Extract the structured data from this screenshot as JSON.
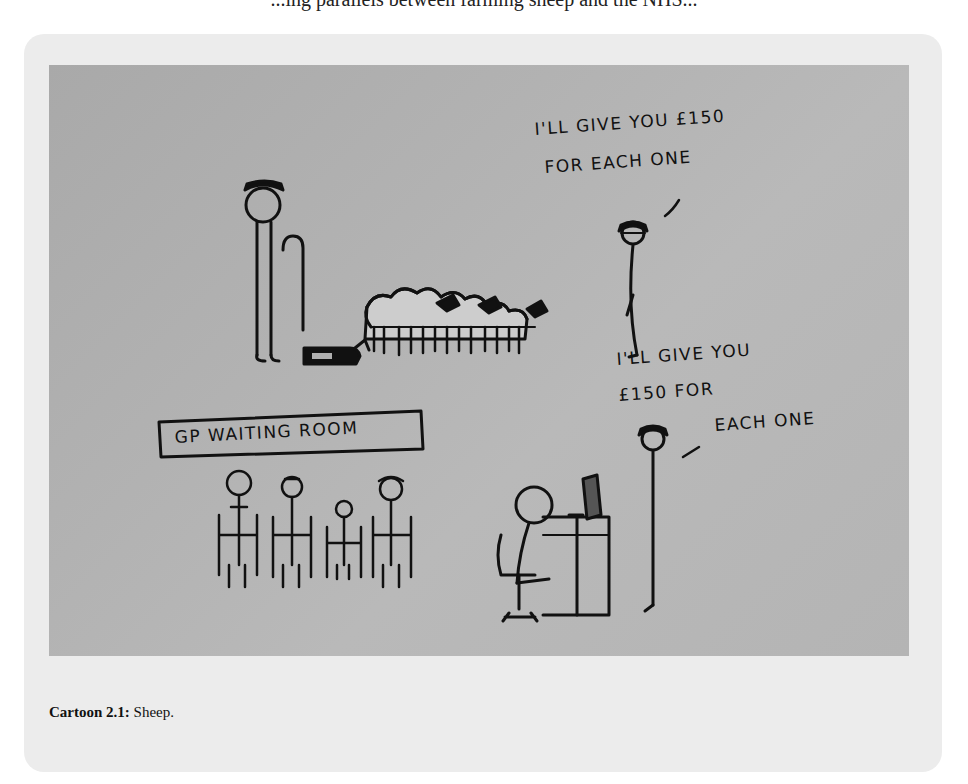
{
  "page": {
    "top_text_fragment": "...ing parallels between farming sheep and the NHS..."
  },
  "figure": {
    "caption_label": "Cartoon 2.1:",
    "caption_text": " Sheep.",
    "panels": [
      {
        "name": "farmer-panel",
        "speech": [
          "I'LL GIVE YOU £150",
          "FOR EACH ONE"
        ],
        "characters": [
          "shepherd-with-crook",
          "sheepdog",
          "flock-of-sheep",
          "buyer-with-hat"
        ]
      },
      {
        "name": "gp-panel",
        "sign": "GP WAITING ROOM",
        "speech": [
          "I'LL GIVE YOU",
          "£150 FOR",
          "EACH ONE"
        ],
        "characters": [
          "seated-patients",
          "receptionist-at-desk",
          "buyer-with-hat"
        ]
      }
    ]
  }
}
